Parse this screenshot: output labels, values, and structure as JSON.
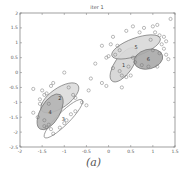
{
  "chart_data": {
    "type": "scatter",
    "title": "iter 1",
    "xlabel": "",
    "ylabel": "",
    "xlim": [
      -2,
      1.5
    ],
    "ylim": [
      -2.5,
      2
    ],
    "xticks": [
      "-2",
      "-1.5",
      "-1",
      "-0.5",
      "0",
      "0.5",
      "1",
      "1.5"
    ],
    "xtick_values": [
      -2,
      -1.5,
      -1,
      -0.5,
      0,
      0.5,
      1,
      1.5
    ],
    "yticks": [
      "2",
      "1.5",
      "1",
      "0.5",
      "0",
      "-0.5",
      "-1",
      "-1.5",
      "-2",
      "-2.5"
    ],
    "ytick_values": [
      2,
      1.5,
      1,
      0.5,
      0,
      -0.5,
      -1,
      -1.5,
      -2,
      -2.5
    ],
    "grid": false,
    "legend": null,
    "caption": "(a)",
    "marker": "open-circle",
    "components": [
      {
        "label": "1",
        "cx": 0.34,
        "cy": 0.26,
        "rx": 0.45,
        "ry": 0.2,
        "angle_deg": -55,
        "fill": "#d4d4d4"
      },
      {
        "label": "2",
        "cx": -1.1,
        "cy": -0.85,
        "rx": 0.5,
        "ry": 0.22,
        "angle_deg": -35,
        "fill": "#dcdcdc"
      },
      {
        "label": "3",
        "cx": -1.02,
        "cy": -1.55,
        "rx": 0.6,
        "ry": 0.14,
        "angle_deg": -45,
        "fill": "#ffffff"
      },
      {
        "label": "4",
        "cx": -1.32,
        "cy": -1.32,
        "rx": 0.45,
        "ry": 0.22,
        "angle_deg": -60,
        "fill": "#b4b4b4"
      },
      {
        "label": "5",
        "cx": 0.62,
        "cy": 0.86,
        "rx": 0.58,
        "ry": 0.2,
        "angle_deg": -20,
        "fill": "#d8d8d8"
      },
      {
        "label": "6",
        "cx": 0.9,
        "cy": 0.45,
        "rx": 0.33,
        "ry": 0.22,
        "angle_deg": -15,
        "fill": "#a8a8a8"
      }
    ],
    "points": [
      [
        1.4,
        1.8
      ],
      [
        0.55,
        1.55
      ],
      [
        0.8,
        1.5
      ],
      [
        1.0,
        1.55
      ],
      [
        1.1,
        1.6
      ],
      [
        0.4,
        1.4
      ],
      [
        0.7,
        1.35
      ],
      [
        1.05,
        1.35
      ],
      [
        1.15,
        1.25
      ],
      [
        1.25,
        1.2
      ],
      [
        1.3,
        1.05
      ],
      [
        1.2,
        0.95
      ],
      [
        1.25,
        0.8
      ],
      [
        1.3,
        0.6
      ],
      [
        1.35,
        0.45
      ],
      [
        1.1,
        0.2
      ],
      [
        0.9,
        0.2
      ],
      [
        0.75,
        0.25
      ],
      [
        0.6,
        0.35
      ],
      [
        0.1,
        1.2
      ],
      [
        0.05,
        0.95
      ],
      [
        -0.15,
        0.9
      ],
      [
        0.2,
        0.9
      ],
      [
        0.25,
        0.75
      ],
      [
        0.15,
        0.6
      ],
      [
        0.0,
        0.55
      ],
      [
        -0.05,
        0.5
      ],
      [
        -0.3,
        0.3
      ],
      [
        0.1,
        0.15
      ],
      [
        0.25,
        0.05
      ],
      [
        0.3,
        -0.1
      ],
      [
        0.4,
        -0.15
      ],
      [
        0.5,
        -0.1
      ],
      [
        0.45,
        0.2
      ],
      [
        0.55,
        0.5
      ],
      [
        1.0,
        0.75
      ],
      [
        1.15,
        0.65
      ],
      [
        0.95,
        1.1
      ],
      [
        -1.7,
        -0.55
      ],
      [
        -1.5,
        -0.6
      ],
      [
        -1.3,
        -0.45
      ],
      [
        -1.25,
        -0.35
      ],
      [
        -1.0,
        -0.0
      ],
      [
        -0.9,
        -0.5
      ],
      [
        -0.8,
        -0.75
      ],
      [
        -0.75,
        -0.85
      ],
      [
        -0.6,
        -1.0
      ],
      [
        -0.5,
        -1.1
      ],
      [
        -0.45,
        -0.6
      ],
      [
        -0.05,
        -0.45
      ],
      [
        -0.15,
        -0.35
      ],
      [
        0.3,
        -0.5
      ],
      [
        -0.4,
        -0.2
      ],
      [
        -1.55,
        -0.9
      ],
      [
        -1.45,
        -0.75
      ],
      [
        -1.4,
        -0.7
      ],
      [
        -1.55,
        -1.05
      ],
      [
        -1.35,
        -1.05
      ],
      [
        -1.7,
        -1.35
      ],
      [
        -1.6,
        -1.5
      ],
      [
        -1.45,
        -1.6
      ],
      [
        -1.45,
        -1.8
      ],
      [
        -1.4,
        -1.85
      ],
      [
        -1.35,
        -1.75
      ],
      [
        -1.3,
        -1.9
      ],
      [
        -1.25,
        -2.05
      ],
      [
        -1.1,
        -1.85
      ],
      [
        -1.0,
        -1.7
      ],
      [
        -0.95,
        -1.6
      ],
      [
        -0.85,
        -1.4
      ],
      [
        -0.75,
        -1.3
      ]
    ]
  }
}
